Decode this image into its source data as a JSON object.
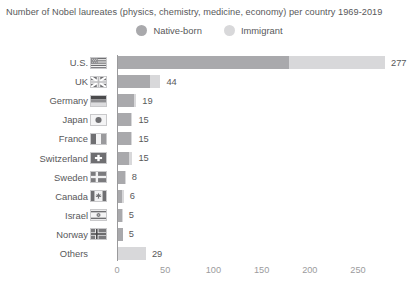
{
  "chart_data": {
    "type": "bar",
    "orientation": "horizontal",
    "stacked": true,
    "title": "Number of Nobel laureates (physics, chemistry, medicine, economy) per country 1969-2019",
    "xlabel": "",
    "ylabel": "",
    "xlim": [
      0,
      280
    ],
    "grid": false,
    "legend_position": "top-center",
    "xticks": [
      0,
      50,
      100,
      150,
      200,
      250
    ],
    "xtick_labels": [
      "0",
      "50",
      "100",
      "150",
      "200",
      "250"
    ],
    "categories": [
      "U.S.",
      "UK",
      "Germany",
      "Japan",
      "France",
      "Switzerland",
      "Sweden",
      "Canada",
      "Israel",
      "Norway",
      "Others"
    ],
    "totals": [
      277,
      44,
      19,
      15,
      15,
      15,
      8,
      6,
      5,
      5,
      29
    ],
    "total_labels": [
      "277",
      "44",
      "19",
      "15",
      "15",
      "15",
      "8",
      "6",
      "5",
      "5",
      "29"
    ],
    "series": [
      {
        "name": "Native-born",
        "color": "#a9a9ac",
        "values": [
          177,
          33,
          17,
          14,
          14,
          11,
          7,
          4,
          4,
          5,
          0
        ]
      },
      {
        "name": "Immigrant",
        "color": "#d8d8da",
        "values": [
          100,
          11,
          2,
          1,
          1,
          4,
          1,
          2,
          1,
          0,
          29
        ]
      }
    ],
    "flags": [
      "us-flag-icon",
      "uk-flag-icon",
      "germany-flag-icon",
      "japan-flag-icon",
      "france-flag-icon",
      "switzerland-flag-icon",
      "sweden-flag-icon",
      "canada-flag-icon",
      "israel-flag-icon",
      "norway-flag-icon",
      null
    ]
  },
  "legend": {
    "items": [
      {
        "label": "Native-born",
        "color": "#a9a9ac"
      },
      {
        "label": "Immigrant",
        "color": "#d8d8da"
      }
    ]
  },
  "colors": {
    "native": "#a9a9ac",
    "immigrant": "#d8d8da",
    "text": "#58585a",
    "tick_text": "#9b9b9d",
    "axis": "#9a9a9c",
    "background": "#ffffff"
  }
}
